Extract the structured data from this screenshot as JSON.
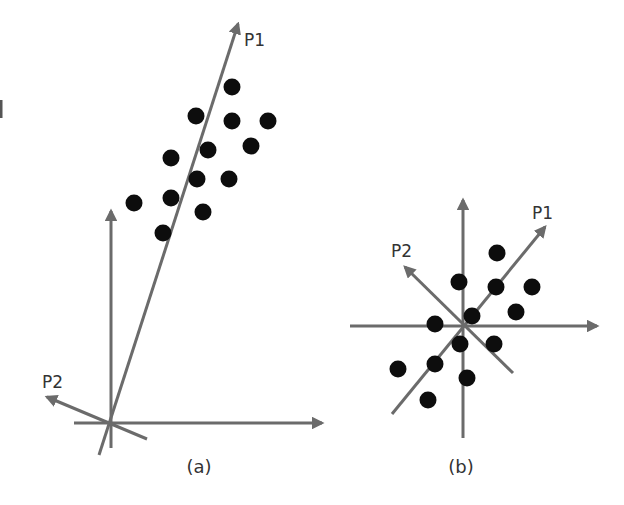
{
  "figure": {
    "panels": [
      {
        "id": "a",
        "caption": "(a)",
        "description": "Original data correlated along a tilted principal axis; axes at lower-left origin",
        "axes": {
          "origin": [
            109,
            422
          ],
          "x_axis_end": [
            322,
            423
          ],
          "x_axis_start": [
            74,
            423
          ],
          "y_axis_top": [
            111,
            211
          ],
          "y_axis_bottom": [
            111,
            448
          ]
        },
        "principal_components": [
          {
            "label": "P1",
            "from": [
              99,
              455
            ],
            "to": [
              238,
              24
            ],
            "label_pos": [
              244,
              46
            ]
          },
          {
            "label": "P2",
            "from": [
              147,
              439
            ],
            "to": [
              47,
              397
            ],
            "label_pos": [
              42,
              388
            ]
          }
        ],
        "points": [
          [
            232,
            87
          ],
          [
            196,
            116
          ],
          [
            232,
            121
          ],
          [
            268,
            121
          ],
          [
            208,
            150
          ],
          [
            251,
            146
          ],
          [
            171,
            158
          ],
          [
            197,
            179
          ],
          [
            229,
            179
          ],
          [
            134,
            203
          ],
          [
            171,
            198
          ],
          [
            203,
            212
          ],
          [
            163,
            233
          ]
        ]
      },
      {
        "id": "b",
        "caption": "(b)",
        "description": "Mean-centered data with principal axes P1 and P2 through the origin",
        "axes": {
          "origin": [
            463,
            326
          ],
          "x_axis_start": [
            350,
            326
          ],
          "x_axis_end": [
            597,
            326
          ],
          "y_axis_top": [
            463,
            200
          ],
          "y_axis_bottom": [
            463,
            438
          ]
        },
        "principal_components": [
          {
            "label": "P1",
            "from": [
              392,
              414
            ],
            "to": [
              545,
              227
            ],
            "label_pos": [
              532,
              219
            ]
          },
          {
            "label": "P2",
            "from": [
              513,
              373
            ],
            "to": [
              405,
              267
            ],
            "label_pos": [
              391,
              257
            ]
          }
        ],
        "points": [
          [
            497,
            253
          ],
          [
            459,
            282
          ],
          [
            496,
            287
          ],
          [
            532,
            287
          ],
          [
            472,
            316
          ],
          [
            516,
            312
          ],
          [
            435,
            324
          ],
          [
            460,
            344
          ],
          [
            494,
            344
          ],
          [
            435,
            364
          ],
          [
            398,
            369
          ],
          [
            467,
            378
          ],
          [
            428,
            400
          ]
        ]
      }
    ],
    "colors": {
      "axis": "#6b6b6b",
      "point": "#0d0d0d",
      "text": "#333333",
      "background": "#ffffff"
    },
    "point_radius": 8.5
  }
}
